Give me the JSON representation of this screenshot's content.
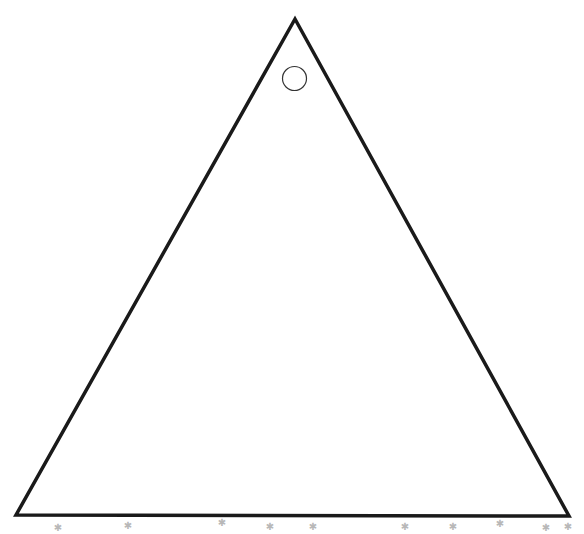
{
  "canvas": {
    "width": 584,
    "height": 534,
    "background": "#ffffff"
  },
  "triangle": {
    "apex": [
      295,
      19
    ],
    "bottom_left": [
      16,
      515
    ],
    "bottom_right": [
      569,
      516
    ],
    "stroke": "#1a1a1a",
    "stroke_width": 3.5
  },
  "circle": {
    "center": [
      294.5,
      78.5
    ],
    "radius": 12,
    "stroke": "#333333",
    "stroke_width": 1.2
  },
  "marks": {
    "color": "#b8b8b8",
    "positions": [
      [
        58,
        531
      ],
      [
        128,
        529
      ],
      [
        222,
        526
      ],
      [
        270,
        530
      ],
      [
        313,
        530
      ],
      [
        405,
        530
      ],
      [
        453,
        530
      ],
      [
        500,
        527
      ],
      [
        546,
        531
      ],
      [
        568,
        530
      ]
    ]
  }
}
